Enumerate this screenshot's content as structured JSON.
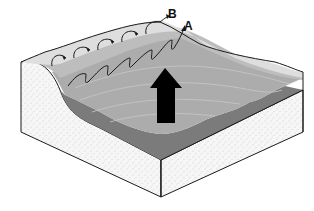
{
  "diagram": {
    "type": "block-diagram",
    "labels": {
      "a": "A",
      "b": "B"
    },
    "elements": [
      {
        "name": "beach-land-slope",
        "color": "#d9d9d9"
      },
      {
        "name": "shallow-water",
        "color": "#b4b4b4"
      },
      {
        "name": "deep-water-front",
        "color": "#7a7a7a"
      },
      {
        "name": "sediment-block",
        "color": "#f7f7f7"
      },
      {
        "name": "wave-direction-arrow",
        "color": "#000000"
      }
    ],
    "colors": {
      "outline": "#1a1a1a",
      "land": "#dcdcdc",
      "water_light": "#bdbdbd",
      "water_mid": "#aaaaaa",
      "water_dark": "#7b7b7b",
      "sediment": "#f6f6f6",
      "arrow": "#000000"
    }
  }
}
